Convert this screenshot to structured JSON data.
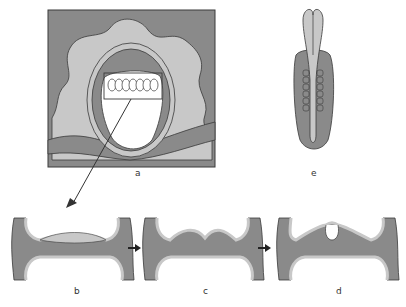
{
  "figure": {
    "panels": [
      {
        "id": "a",
        "label": "a",
        "description": "Embryo within uterine wall, boxed region of neural plate"
      },
      {
        "id": "b",
        "label": "b",
        "description": "Flat neural plate"
      },
      {
        "id": "c",
        "label": "c",
        "description": "Neural folds rising"
      },
      {
        "id": "d",
        "label": "d",
        "description": "Neural groove forming"
      },
      {
        "id": "e",
        "label": "e",
        "description": "Dorsal view of embryo with somites"
      }
    ],
    "colors": {
      "dark_gray": "#8a8a8a",
      "mid_gray": "#a6a6a6",
      "light_gray": "#c8c8c8",
      "outline": "#3a3a3a",
      "white": "#ffffff"
    }
  }
}
